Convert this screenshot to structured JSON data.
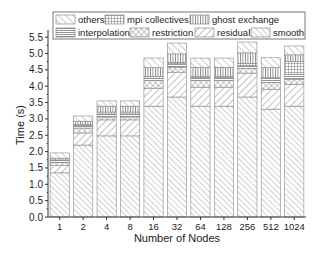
{
  "chart_data": {
    "type": "bar",
    "stacked": true,
    "title": "",
    "xlabel": "Number of Nodes",
    "ylabel": "Time (s)",
    "ylim": [
      0,
      5.6
    ],
    "yticks": [
      "0.0",
      "0.5",
      "1.0",
      "1.5",
      "2.0",
      "2.5",
      "3.0",
      "3.5",
      "4.0",
      "4.5",
      "5.0",
      "5.5"
    ],
    "grid": false,
    "legend_position": "top, inside plot, 3 columns",
    "categories": [
      "1",
      "2",
      "4",
      "8",
      "16",
      "32",
      "64",
      "128",
      "256",
      "512",
      "1024"
    ],
    "series": [
      {
        "name": "smooth",
        "pattern": "diag-fwd-fine",
        "values": [
          1.35,
          2.2,
          2.48,
          2.48,
          3.39,
          3.67,
          3.39,
          3.39,
          3.67,
          3.3,
          3.39
        ]
      },
      {
        "name": "residual",
        "pattern": "diag-back",
        "values": [
          0.22,
          0.37,
          0.49,
          0.49,
          0.55,
          0.76,
          0.58,
          0.58,
          0.73,
          0.61,
          0.67
        ]
      },
      {
        "name": "restriction",
        "pattern": "crosshatch",
        "values": [
          0.09,
          0.15,
          0.09,
          0.09,
          0.24,
          0.15,
          0.21,
          0.21,
          0.15,
          0.21,
          0.15
        ]
      },
      {
        "name": "interpolation",
        "pattern": "horizontal",
        "values": [
          0.06,
          0.08,
          0.09,
          0.09,
          0.06,
          0.09,
          0.09,
          0.09,
          0.09,
          0.12,
          0.15
        ]
      },
      {
        "name": "mpi collectives",
        "pattern": "grid",
        "values": [
          0.02,
          0.03,
          0.06,
          0.06,
          0.06,
          0.06,
          0.02,
          0.02,
          0.06,
          0.02,
          0.4
        ]
      },
      {
        "name": "ghost exchange",
        "pattern": "vertical",
        "values": [
          0.06,
          0.1,
          0.18,
          0.18,
          0.27,
          0.26,
          0.29,
          0.29,
          0.32,
          0.31,
          0.2
        ]
      },
      {
        "name": "others",
        "pattern": "diag-fwd",
        "values": [
          0.16,
          0.16,
          0.16,
          0.16,
          0.29,
          0.33,
          0.28,
          0.28,
          0.33,
          0.3,
          0.27
        ]
      }
    ],
    "totals": [
      1.96,
      3.09,
      3.55,
      3.55,
      4.86,
      5.32,
      4.86,
      4.86,
      5.35,
      4.87,
      5.23
    ]
  },
  "legend": {
    "row1": [
      "others",
      "mpi collectives",
      "ghost exchange"
    ],
    "row2": [
      "interpolation",
      "restriction",
      "residual",
      "smooth"
    ]
  },
  "axes": {
    "xlabel": "Number of Nodes",
    "ylabel": "Time (s)"
  }
}
